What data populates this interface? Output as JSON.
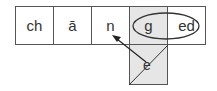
{
  "diagram": {
    "cells": [
      {
        "label": "ch"
      },
      {
        "label": "ā"
      },
      {
        "label": "n"
      },
      {
        "label": "g"
      },
      {
        "label": "ed"
      }
    ],
    "deleted_letter": "e",
    "annotations": {
      "ellipse_groups": [
        "g",
        "ed"
      ],
      "arrow_from": "e",
      "arrow_to": "n",
      "strikethrough": "e"
    },
    "colors": {
      "border": "#555555",
      "highlight": "#e6e6e6",
      "text": "#333333"
    }
  }
}
